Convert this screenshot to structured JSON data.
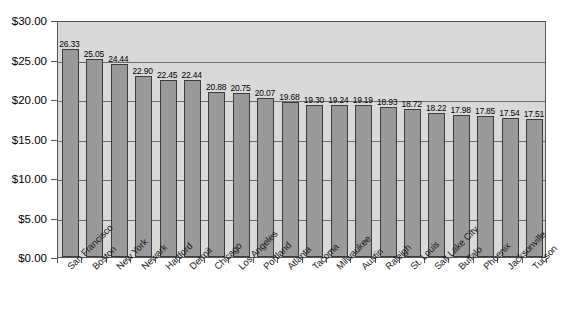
{
  "chart_data": {
    "type": "bar",
    "title": "",
    "subtitle": "",
    "xlabel": "",
    "ylabel": "",
    "ylim": [
      0,
      30
    ],
    "ytick_step": 5,
    "grid": true,
    "grid_axis": "y",
    "legend": "none",
    "orientation": "vertical",
    "value_labels": true,
    "value_label_format": "0.00",
    "categories": [
      "San Francisco",
      "Boston",
      "New York",
      "Newark",
      "Hartford",
      "Detroit",
      "Chicago",
      "Los Angeles",
      "Portland",
      "Atlanta",
      "Tacoma",
      "Milwaukee",
      "Austin",
      "Raleigh",
      "St. Louis",
      "Salt Lake City",
      "Buffalo",
      "Phoenix",
      "Jacksonville",
      "Tucson"
    ],
    "values": [
      26.33,
      25.05,
      24.44,
      22.9,
      22.45,
      22.44,
      20.88,
      20.75,
      20.07,
      19.68,
      19.3,
      19.24,
      19.19,
      18.93,
      18.72,
      18.22,
      17.98,
      17.85,
      17.54,
      17.51
    ],
    "value_labels_text": [
      "26.33",
      "25.05",
      "24.44",
      "22.90",
      "22.45",
      "22.44",
      "20.88",
      "20.75",
      "20.07",
      "19.68",
      "19.30",
      "19.24",
      "19.19",
      "18.93",
      "18.72",
      "18.22",
      "17.98",
      "17.85",
      "17.54",
      "17.51"
    ],
    "ytick_labels": [
      "$0.00",
      "$5.00",
      "$10.00",
      "$15.00",
      "$20.00",
      "$25.00",
      "$30.00"
    ],
    "ytick_values": [
      0,
      5,
      10,
      15,
      20,
      25,
      30
    ],
    "colors": {
      "bar_fill": "#999999",
      "bar_border": "#3d3d3d",
      "plot_background": "#d9d9d9",
      "gridline": "#6e6e6e",
      "axis": "#555555",
      "text": "#000000",
      "page_background": "#ffffff"
    }
  }
}
